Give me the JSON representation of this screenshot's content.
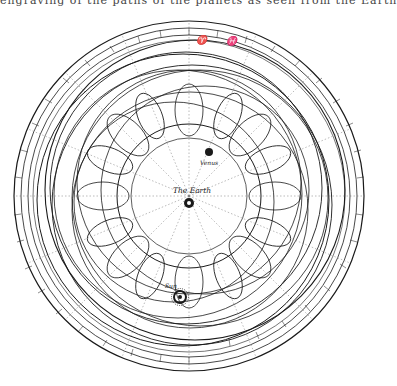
{
  "caption": "engraving of the paths of the planets as seen from the Earth",
  "diagram": {
    "center_label": "The Earth",
    "planets": [
      {
        "name": "Venus",
        "x": 210,
        "y": 152
      },
      {
        "name": "Sun",
        "x": 180,
        "y": 296
      }
    ],
    "zodiac_top": [
      "♈",
      "♓"
    ],
    "colors": {
      "ink": "#1a1a1a",
      "paper": "#ffffff",
      "dotted": "#777777"
    }
  }
}
